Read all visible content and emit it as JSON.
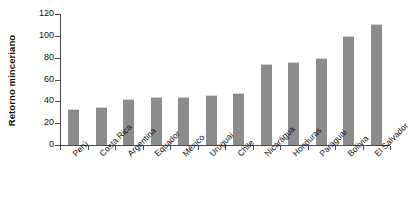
{
  "chart_data": {
    "type": "bar",
    "title": "",
    "xlabel": "",
    "ylabel": "Retorno minceriano",
    "ylim": [
      0,
      120
    ],
    "yticks": [
      0,
      20,
      40,
      60,
      80,
      100,
      120
    ],
    "grid": false,
    "legend": null,
    "bar_color": "#8c8c8c",
    "axis_color": "#4a4a4a",
    "categories": [
      "Perú",
      "Costa Rica",
      "Argentina",
      "Equador",
      "México",
      "Uruguai",
      "Chile",
      "Nicarágua",
      "Honduras",
      "Paraguai",
      "Bolívia",
      "El Salvador"
    ],
    "values": [
      33,
      35,
      42,
      44,
      44,
      46,
      48,
      74,
      76,
      80,
      100,
      111
    ]
  }
}
